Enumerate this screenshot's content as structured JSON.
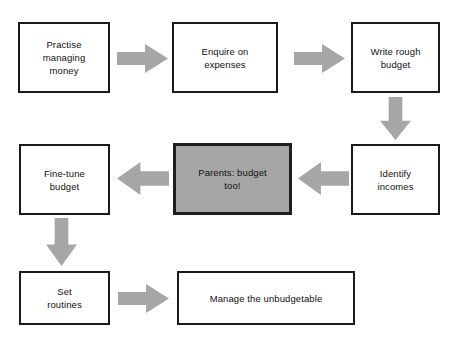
{
  "diagram": {
    "colors": {
      "background": "#ffffff",
      "box_fill": "#ffffff",
      "box_border": "#1a1a1a",
      "highlight_fill": "#a6a6a6",
      "highlight_border": "#1f1f1f",
      "arrow_fill": "#a6a6a6",
      "text": "#111111"
    },
    "nodes": [
      {
        "id": "practise-managing-money",
        "label": "Practise\nmanaging\nmoney",
        "highlighted": false,
        "x": 18,
        "y": 22,
        "w": 92,
        "h": 71
      },
      {
        "id": "enquire-on-expenses",
        "label": "Enquire on\nexpenses",
        "highlighted": false,
        "x": 172,
        "y": 22,
        "w": 106,
        "h": 71
      },
      {
        "id": "write-rough-budget",
        "label": "Write rough\nbudget",
        "highlighted": false,
        "x": 351,
        "y": 22,
        "w": 89,
        "h": 71
      },
      {
        "id": "identify-incomes",
        "label": "Identify\nincomes",
        "highlighted": false,
        "x": 351,
        "y": 144,
        "w": 89,
        "h": 71
      },
      {
        "id": "parents-budget-too",
        "label": "Parents: budget\ntoo!",
        "highlighted": true,
        "x": 173,
        "y": 143,
        "w": 119,
        "h": 72
      },
      {
        "id": "fine-tune-budget",
        "label": "Fine-tune\nbudget",
        "highlighted": false,
        "x": 19,
        "y": 144,
        "w": 91,
        "h": 71
      },
      {
        "id": "set-routines",
        "label": "Set\nroutines",
        "highlighted": false,
        "x": 19,
        "y": 271,
        "w": 91,
        "h": 54
      },
      {
        "id": "manage-the-unbudgetable",
        "label": "Manage the unbudgetable",
        "highlighted": false,
        "x": 177,
        "y": 271,
        "w": 178,
        "h": 54
      }
    ],
    "arrows": [
      {
        "id": "arrow-practise-to-enquire",
        "direction": "right",
        "from": "practise-managing-money",
        "to": "enquire-on-expenses",
        "x": 117,
        "y": 44,
        "w": 51,
        "h": 29
      },
      {
        "id": "arrow-enquire-to-write",
        "direction": "right",
        "from": "enquire-on-expenses",
        "to": "write-rough-budget",
        "x": 294,
        "y": 44,
        "w": 51,
        "h": 29
      },
      {
        "id": "arrow-write-to-identify",
        "direction": "down",
        "from": "write-rough-budget",
        "to": "identify-incomes",
        "x": 380,
        "y": 97,
        "w": 31,
        "h": 43
      },
      {
        "id": "arrow-identify-to-parents",
        "direction": "left",
        "from": "identify-incomes",
        "to": "parents-budget-too",
        "x": 298,
        "y": 162,
        "w": 51,
        "h": 33
      },
      {
        "id": "arrow-parents-to-finetune",
        "direction": "left",
        "from": "parents-budget-too",
        "to": "fine-tune-budget",
        "x": 117,
        "y": 162,
        "w": 52,
        "h": 33
      },
      {
        "id": "arrow-finetune-to-routines",
        "direction": "down",
        "from": "fine-tune-budget",
        "to": "set-routines",
        "x": 46,
        "y": 218,
        "w": 31,
        "h": 48
      },
      {
        "id": "arrow-routines-to-manage",
        "direction": "right",
        "from": "set-routines",
        "to": "manage-the-unbudgetable",
        "x": 118,
        "y": 284,
        "w": 51,
        "h": 29
      }
    ]
  }
}
